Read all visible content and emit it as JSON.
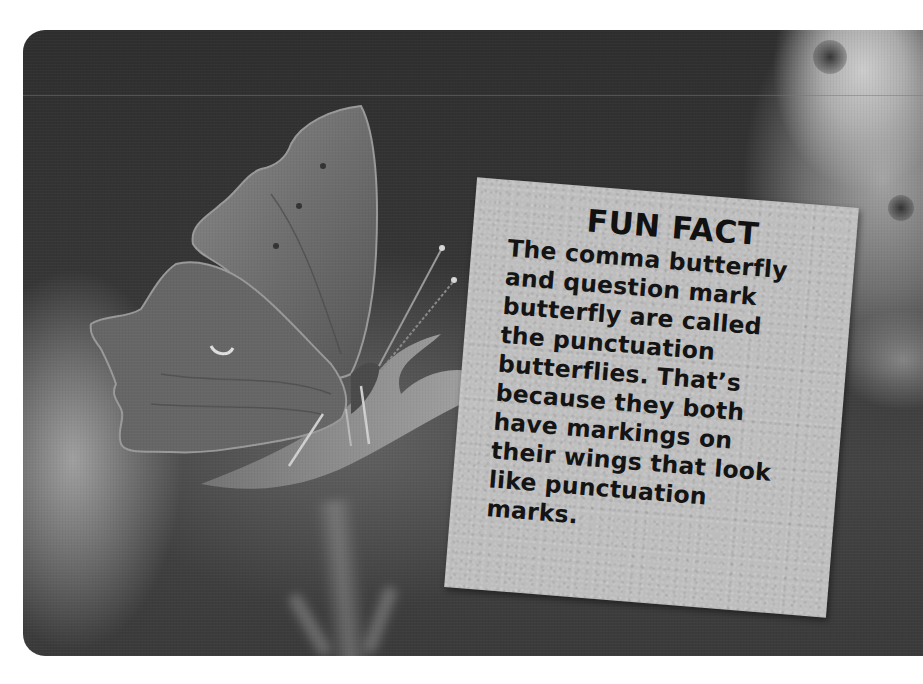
{
  "photo": {
    "subject": "comma butterfly perched on a leaf",
    "style": "black-and-white photograph with rounded corners",
    "colors": {
      "background_dark": "#333333",
      "card": "#bdbdbd",
      "text": "#111111",
      "page": "#ffffff"
    }
  },
  "fun_fact": {
    "title": "FUN FACT",
    "lines": [
      "The comma butterfly",
      "and question mark",
      "butterfly are called",
      "the punctuation",
      "butterflies. That’s",
      "because they both",
      "have markings on",
      "their wings that look",
      "like punctuation",
      "marks."
    ]
  }
}
